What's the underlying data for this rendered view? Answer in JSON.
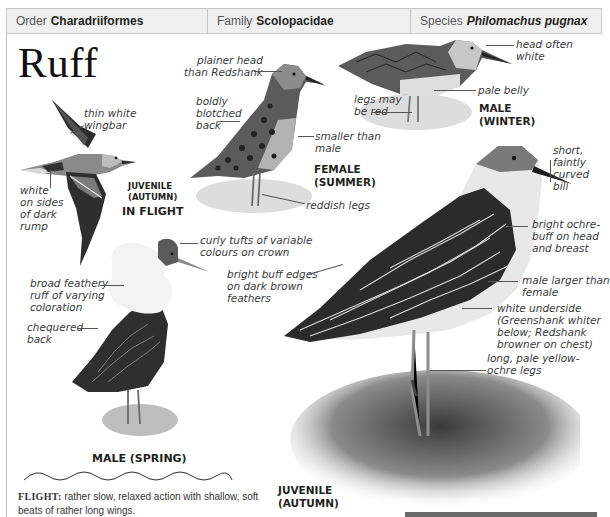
{
  "header": {
    "order": {
      "label": "Order",
      "value": "Charadriiformes"
    },
    "family": {
      "label": "Family",
      "value": "Scolopacidae"
    },
    "species": {
      "label": "Species",
      "value": "Philomachus pugnax"
    }
  },
  "title": "Ruff",
  "figures": {
    "juvenile_flight": {
      "label_line1": "JUVENILE",
      "label_line2": "(AUTUMN)",
      "label_line3": "IN FLIGHT",
      "annotations": [
        {
          "lines": [
            "thin white",
            "wingbar"
          ]
        },
        {
          "lines": [
            "white",
            "on sides",
            "of dark",
            "rump"
          ]
        }
      ]
    },
    "female_summer": {
      "label_line1": "FEMALE",
      "label_line2": "(SUMMER)",
      "annotations": [
        {
          "lines": [
            "plainer head",
            "than Redshank"
          ]
        },
        {
          "lines": [
            "boldly",
            "blotched",
            "back"
          ]
        },
        {
          "lines": [
            "smaller than",
            "male"
          ]
        },
        {
          "lines": [
            "reddish legs"
          ]
        }
      ]
    },
    "male_winter": {
      "label_line1": "MALE",
      "label_line2": "(WINTER)",
      "annotations": [
        {
          "lines": [
            "head often",
            "white"
          ]
        },
        {
          "lines": [
            "pale belly"
          ]
        },
        {
          "lines": [
            "legs may",
            "be red"
          ]
        }
      ]
    },
    "male_spring": {
      "label": "MALE (SPRING)",
      "annotations": [
        {
          "lines": [
            "curly tufts of variable",
            "colours on crown"
          ]
        },
        {
          "lines": [
            "broad feathery",
            "ruff of varying",
            "coloration"
          ]
        },
        {
          "lines": [
            "chequered",
            "back"
          ]
        }
      ]
    },
    "juvenile_autumn": {
      "label_line1": "JUVENILE",
      "label_line2": "(AUTUMN)",
      "annotations": [
        {
          "lines": [
            "short,",
            "faintly",
            "curved",
            "bill"
          ]
        },
        {
          "lines": [
            "bright ochre-",
            "buff on head",
            "and breast"
          ]
        },
        {
          "lines": [
            "bright buff edges",
            "on dark brown",
            "feathers"
          ]
        },
        {
          "lines": [
            "male larger than",
            "female"
          ]
        },
        {
          "lines": [
            "white underside",
            "(Greenshank whiter",
            "below; Redshank",
            "browner on chest)"
          ]
        },
        {
          "lines": [
            "long, pale yellow-",
            "ochre legs"
          ]
        }
      ]
    }
  },
  "flight_note": {
    "label": "FLIGHT:",
    "text": "rather slow, relaxed action with shallow, soft beats of rather long wings."
  },
  "icons": {
    "flight_pattern": "wavy-line-icon"
  },
  "colors": {
    "header_bg": "#f0f0f0",
    "header_border": "#c8c8c8",
    "text": "#231f20",
    "annotation": "#3a3a3a"
  }
}
